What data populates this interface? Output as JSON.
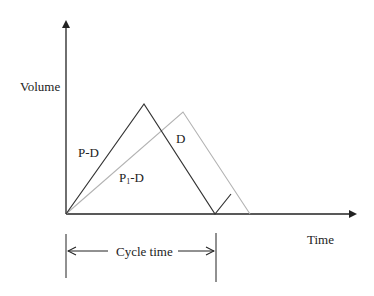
{
  "diagram": {
    "type": "inventory-cycle",
    "axes": {
      "y_label": "Volume",
      "x_label": "Time"
    },
    "series": [
      {
        "name": "Production rate P (dark)",
        "rise_label": "P-D",
        "fall_label": "D",
        "color": "#333333",
        "points": [
          [
            66,
            214
          ],
          [
            144,
            104
          ],
          [
            215,
            214
          ],
          [
            231,
            194
          ]
        ]
      },
      {
        "name": "Production rate P1 (light)",
        "rise_label_main": "P",
        "rise_label_sub": "1",
        "rise_label_tail": "-D",
        "color": "#b3b3b3",
        "points": [
          [
            66,
            214
          ],
          [
            183,
            112
          ],
          [
            250,
            214
          ]
        ]
      }
    ],
    "annotations": {
      "cycle_label": "Cycle time",
      "fall_label": "D"
    }
  }
}
